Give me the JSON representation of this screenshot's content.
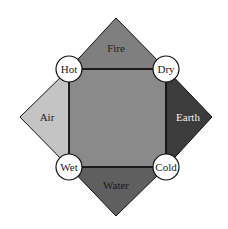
{
  "diagram": {
    "elements": [
      {
        "name": "Fire",
        "position": "top",
        "color": "#7f7f7f",
        "text_color": "#222222"
      },
      {
        "name": "Air",
        "position": "left",
        "color": "#c4c4c4",
        "text_color": "#222222"
      },
      {
        "name": "Earth",
        "position": "right",
        "color": "#3c3c3c",
        "text_color": "#f0f0f0"
      },
      {
        "name": "Water",
        "position": "bottom",
        "color": "#5f5f5f",
        "text_color": "#1a1a1a"
      }
    ],
    "qualities": [
      {
        "name": "Hot",
        "position": "top-left"
      },
      {
        "name": "Dry",
        "position": "top-right"
      },
      {
        "name": "Wet",
        "position": "bottom-left"
      },
      {
        "name": "Cold",
        "position": "bottom-right"
      }
    ],
    "center_color": "#8a8a8a",
    "stroke_color": "#111111",
    "circle_fill": "#ffffff"
  }
}
